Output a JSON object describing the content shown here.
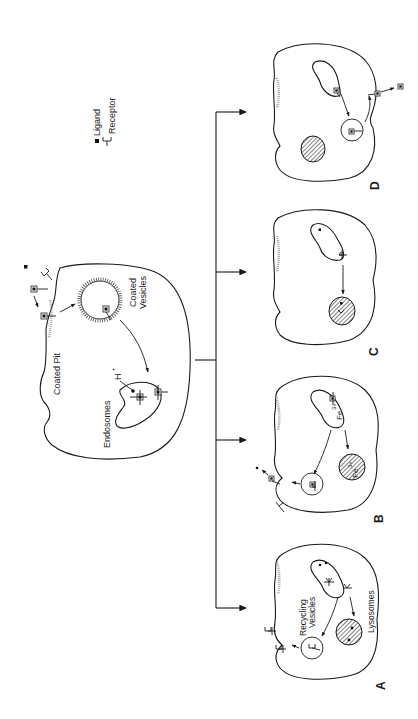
{
  "figure": {
    "orientation": "rotated 90° counter-clockwise",
    "legend": {
      "ligand_label": "Ligand",
      "receptor_label": "Receptor",
      "ligand_icon": "filled-square",
      "receptor_icon": "y-shaped-receptor"
    },
    "main_cell": {
      "labels": {
        "coated_pit": "Coated Pit",
        "coated_vesicles_line1": "Coated",
        "coated_vesicles_line2": "Vesicles",
        "endosomes": "Endosomes",
        "proton": "H",
        "proton_charge": "+"
      }
    },
    "panels": [
      {
        "id": "A",
        "label": "A",
        "labels": {
          "recycling_line1": "Recycling",
          "recycling_line2": "Vesicles",
          "lysosomes": "Lysosomes"
        }
      },
      {
        "id": "B",
        "label": "B",
        "labels": {
          "iron_endosome": "Fe",
          "iron_endosome_charge": "3+",
          "iron_lysosome": "Fe",
          "iron_lysosome_charge": "3+"
        }
      },
      {
        "id": "C",
        "label": "C"
      },
      {
        "id": "D",
        "label": "D"
      }
    ],
    "colors": {
      "line": "#1a1a1a",
      "background": "#ffffff",
      "coat": "#8a8a8a"
    }
  }
}
